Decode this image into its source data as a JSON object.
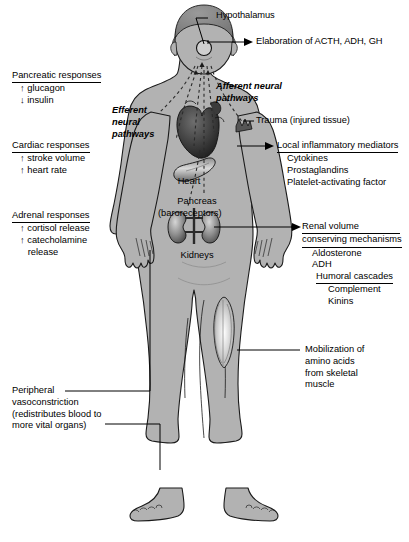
{
  "figure": {
    "body_fill": "#b2b2b2",
    "body_stroke": "#1a1a1a",
    "organ_dark": "#4a4a4a",
    "text_color": "#000000"
  },
  "callouts": {
    "hypothalamus": {
      "label": "Hypothalamus"
    },
    "elaboration": {
      "label": "Elaboration of ACTH, ADH, GH"
    },
    "afferent": {
      "line1": "Afferent neural",
      "line2": "pathways"
    },
    "efferent": {
      "line1": "Efferent",
      "line2": "neural",
      "line3": "pathways"
    },
    "trauma": {
      "label": "Trauma (injured tissue)"
    }
  },
  "organs": {
    "heart": {
      "name": "Heart",
      "sub": "(baroreceptors)"
    },
    "pancreas": {
      "name": "Pancreas"
    },
    "kidneys": {
      "name": "Kidneys"
    }
  },
  "left_blocks": [
    {
      "id": "pancreatic-responses",
      "header": "Pancreatic responses",
      "items": [
        "↑ glucagon",
        "↓ insulin"
      ]
    },
    {
      "id": "cardiac-responses",
      "header": "Cardiac responses",
      "items": [
        "↑ stroke volume",
        "↑ heart rate"
      ]
    },
    {
      "id": "adrenal-responses",
      "header": "Adrenal responses",
      "items": [
        "↑ cortisol release",
        "↑ catecholamine",
        "   release"
      ]
    },
    {
      "id": "peripheral-vasoconstriction",
      "header": null,
      "items": [
        "Peripheral",
        "vasoconstriction",
        "(redistributes blood to",
        "more vital organs)"
      ]
    }
  ],
  "right_blocks": [
    {
      "id": "local-inflammatory-mediators",
      "header": "Local inflammatory mediators",
      "items": [
        "Cytokines",
        "Prostaglandins",
        "Platelet-activating factor"
      ]
    },
    {
      "id": "renal-volume-conserving-mechanisms",
      "header_line1": "Renal volume",
      "header_line2": "conserving mechanisms",
      "items": [
        "Aldosterone",
        "ADH"
      ],
      "sub_header": "Humoral cascades",
      "sub_items": [
        "Complement",
        "Kinins"
      ]
    },
    {
      "id": "mobilization-amino-acids",
      "header": null,
      "items": [
        "Mobilization of",
        "amino acids",
        "from skeletal",
        "muscle"
      ]
    }
  ]
}
